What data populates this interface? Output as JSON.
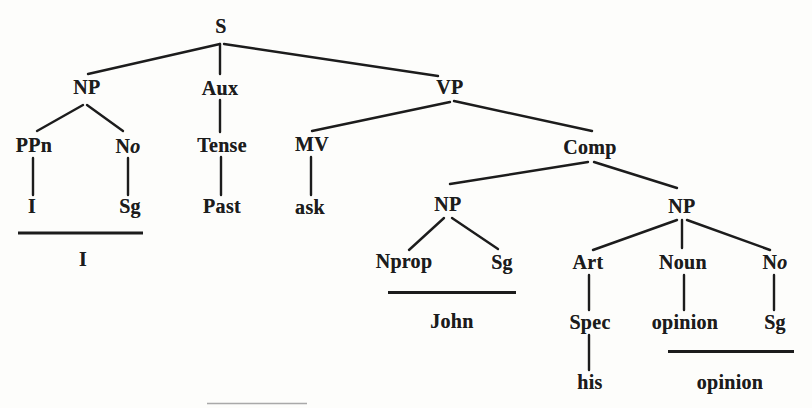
{
  "diagram": {
    "type": "syntax-tree",
    "colors": {
      "ink": "#1c1c1c",
      "paper": "#fdfdfb",
      "faint_line": "#a9a9a9"
    },
    "stroke": {
      "edge_width": 2.4,
      "underline_width": 2.8,
      "faint_width": 1.6
    },
    "nodes": [
      {
        "name": "node-s",
        "label": "S",
        "x": 221,
        "y": 26
      },
      {
        "name": "node-np-subject",
        "label": "NP",
        "x": 87,
        "y": 87
      },
      {
        "name": "node-aux",
        "label": "Aux",
        "x": 220,
        "y": 88
      },
      {
        "name": "node-vp",
        "label": "VP",
        "x": 450,
        "y": 87
      },
      {
        "name": "node-ppn",
        "label": "PPn",
        "x": 34,
        "y": 145
      },
      {
        "name": "node-no-1",
        "label": "No",
        "italic_tail": 1,
        "x": 128,
        "y": 146
      },
      {
        "name": "node-tense",
        "label": "Tense",
        "x": 222,
        "y": 145
      },
      {
        "name": "node-mv",
        "label": "MV",
        "x": 312,
        "y": 144
      },
      {
        "name": "node-comp",
        "label": "Comp",
        "x": 590,
        "y": 147
      },
      {
        "name": "terminal-i",
        "label": "I",
        "x": 32,
        "y": 206
      },
      {
        "name": "terminal-sg-1",
        "label": "Sg",
        "x": 130,
        "y": 206
      },
      {
        "name": "terminal-past",
        "label": "Past",
        "x": 222,
        "y": 206
      },
      {
        "name": "terminal-ask",
        "label": "ask",
        "x": 310,
        "y": 207
      },
      {
        "name": "node-np-object-1",
        "label": "NP",
        "x": 448,
        "y": 204
      },
      {
        "name": "node-np-object-2",
        "label": "NP",
        "x": 682,
        "y": 206
      },
      {
        "name": "node-nprop",
        "label": "Nprop",
        "x": 404,
        "y": 261
      },
      {
        "name": "terminal-sg-2",
        "label": "Sg",
        "x": 502,
        "y": 262
      },
      {
        "name": "node-art",
        "label": "Art",
        "x": 588,
        "y": 262
      },
      {
        "name": "node-noun",
        "label": "Noun",
        "x": 683,
        "y": 262
      },
      {
        "name": "node-no-2",
        "label": "No",
        "italic_tail": 1,
        "x": 775,
        "y": 262
      },
      {
        "name": "word-i",
        "label": "I",
        "x": 83,
        "y": 259
      },
      {
        "name": "word-john",
        "label": "John",
        "x": 452,
        "y": 321
      },
      {
        "name": "node-spec",
        "label": "Spec",
        "x": 590,
        "y": 322
      },
      {
        "name": "terminal-opinion",
        "label": "opinion",
        "x": 685,
        "y": 322
      },
      {
        "name": "terminal-sg-3",
        "label": "Sg",
        "x": 775,
        "y": 322
      },
      {
        "name": "word-his",
        "label": "his",
        "x": 590,
        "y": 382
      },
      {
        "name": "word-opinion",
        "label": "opinion",
        "x": 730,
        "y": 382
      }
    ],
    "edges": [
      {
        "name": "edge-s-np",
        "x1": 220,
        "y1": 44,
        "x2": 88,
        "y2": 74
      },
      {
        "name": "edge-s-aux",
        "x1": 220,
        "y1": 44,
        "x2": 220,
        "y2": 74
      },
      {
        "name": "edge-s-vp",
        "x1": 224,
        "y1": 44,
        "x2": 438,
        "y2": 76
      },
      {
        "name": "edge-np-ppn",
        "x1": 83,
        "y1": 105,
        "x2": 37,
        "y2": 131
      },
      {
        "name": "edge-np-no",
        "x1": 87,
        "y1": 105,
        "x2": 123,
        "y2": 131
      },
      {
        "name": "edge-ppn-i",
        "x1": 33,
        "y1": 158,
        "x2": 33,
        "y2": 195
      },
      {
        "name": "edge-no-sg",
        "x1": 128,
        "y1": 158,
        "x2": 128,
        "y2": 195
      },
      {
        "name": "edge-aux-tense",
        "x1": 220,
        "y1": 100,
        "x2": 220,
        "y2": 132
      },
      {
        "name": "edge-tense-past",
        "x1": 221,
        "y1": 157,
        "x2": 221,
        "y2": 195
      },
      {
        "name": "edge-vp-mv",
        "x1": 450,
        "y1": 102,
        "x2": 312,
        "y2": 131
      },
      {
        "name": "edge-vp-comp",
        "x1": 454,
        "y1": 101,
        "x2": 592,
        "y2": 131
      },
      {
        "name": "edge-mv-ask",
        "x1": 311,
        "y1": 157,
        "x2": 311,
        "y2": 195
      },
      {
        "name": "edge-comp-np1",
        "x1": 588,
        "y1": 162,
        "x2": 450,
        "y2": 184
      },
      {
        "name": "edge-comp-np2",
        "x1": 594,
        "y1": 162,
        "x2": 677,
        "y2": 188
      },
      {
        "name": "edge-np1-nprop",
        "x1": 444,
        "y1": 218,
        "x2": 409,
        "y2": 250
      },
      {
        "name": "edge-np1-sg",
        "x1": 452,
        "y1": 218,
        "x2": 498,
        "y2": 249
      },
      {
        "name": "edge-np2-art",
        "x1": 677,
        "y1": 220,
        "x2": 593,
        "y2": 250
      },
      {
        "name": "edge-np2-noun",
        "x1": 682,
        "y1": 220,
        "x2": 682,
        "y2": 248
      },
      {
        "name": "edge-np2-no",
        "x1": 687,
        "y1": 220,
        "x2": 770,
        "y2": 250
      },
      {
        "name": "edge-art-spec",
        "x1": 589,
        "y1": 275,
        "x2": 589,
        "y2": 310
      },
      {
        "name": "edge-spec-his",
        "x1": 589,
        "y1": 335,
        "x2": 589,
        "y2": 370
      },
      {
        "name": "edge-noun-opinion",
        "x1": 684,
        "y1": 275,
        "x2": 684,
        "y2": 310
      },
      {
        "name": "edge-no2-sg",
        "x1": 774,
        "y1": 275,
        "x2": 774,
        "y2": 310
      }
    ],
    "underlines": [
      {
        "name": "underline-i",
        "x1": 18,
        "x2": 143,
        "y": 233
      },
      {
        "name": "underline-john",
        "x1": 388,
        "x2": 516,
        "y": 292.5
      },
      {
        "name": "underline-opinion",
        "x1": 668,
        "x2": 794,
        "y": 351.5
      },
      {
        "name": "scan-artifact-line",
        "x1": 207,
        "x2": 307,
        "y": 403.5,
        "faint": true
      }
    ]
  }
}
